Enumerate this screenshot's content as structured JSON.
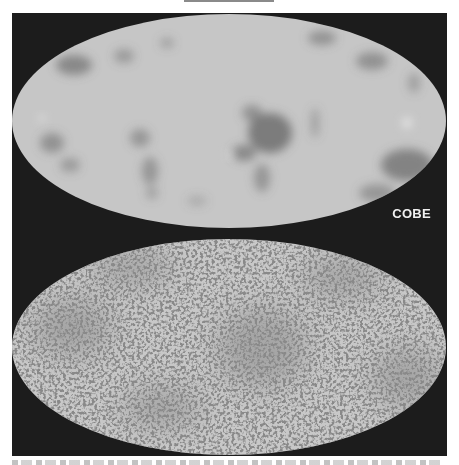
{
  "figure": {
    "panels": [
      {
        "id": "cobe",
        "label": "COBE",
        "description": "All-sky map of cosmic microwave background, low resolution, smooth blotches"
      },
      {
        "id": "wmap",
        "label": "WMAP",
        "description": "All-sky map of cosmic microwave background, high resolution, fine speckled structure"
      }
    ],
    "colors": {
      "background": "#1c1c1c",
      "map_base": "#c4c4c4",
      "map_dark": "#5a5a5a",
      "label": "#f0f0f0"
    }
  }
}
